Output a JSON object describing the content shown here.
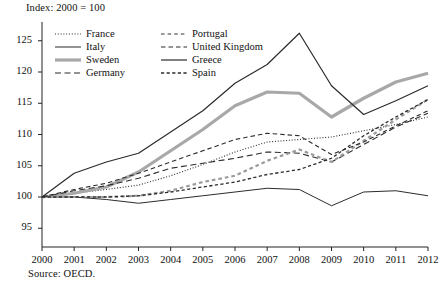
{
  "figure": {
    "index_note": "Index: 2000 = 100",
    "source_note": "Source: OECD."
  },
  "chart_data": {
    "type": "line",
    "title": "Index: 2000 = 100",
    "subtitle": "",
    "xlabel": "",
    "ylabel": "",
    "note": "Index: 2000 = 100",
    "source": "Source: OECD.",
    "grid": false,
    "legend_position": "top-left-inside",
    "x": [
      2000,
      2001,
      2002,
      2003,
      2004,
      2005,
      2006,
      2007,
      2008,
      2009,
      2010,
      2011,
      2012
    ],
    "xlim": [
      2000,
      2012
    ],
    "ylim": [
      92,
      128
    ],
    "yticks": [
      95,
      100,
      105,
      110,
      115,
      120,
      125
    ],
    "xticks": [
      2000,
      2001,
      2002,
      2003,
      2004,
      2005,
      2006,
      2007,
      2008,
      2009,
      2010,
      2011,
      2012
    ],
    "series": [
      {
        "name": "France",
        "style": "dotted",
        "color": "#2b2b2b",
        "width": 1.1,
        "values": [
          100.0,
          100.6,
          101.2,
          101.9,
          103.4,
          105.2,
          107.2,
          108.8,
          109.2,
          109.6,
          110.6,
          111.6,
          112.8
        ]
      },
      {
        "name": "Italy",
        "style": "solid",
        "color": "#2b2b2b",
        "width": 1.0,
        "values": [
          100.0,
          100.0,
          99.6,
          99.0,
          99.6,
          100.2,
          100.8,
          101.4,
          101.2,
          98.6,
          100.8,
          101.0,
          100.2
        ]
      },
      {
        "name": "Sweden",
        "style": "solid",
        "color": "#a8a8a8",
        "width": 3.2,
        "values": [
          100.0,
          100.6,
          101.6,
          104.0,
          107.4,
          110.8,
          114.6,
          116.8,
          116.6,
          112.8,
          115.8,
          118.4,
          119.8
        ]
      },
      {
        "name": "Germany",
        "style": "dashed",
        "color": "#2b2b2b",
        "width": 1.1,
        "values": [
          100.0,
          101.0,
          101.8,
          103.0,
          104.6,
          105.4,
          106.2,
          107.2,
          107.0,
          105.6,
          108.4,
          111.2,
          113.4
        ]
      },
      {
        "name": "Portugal",
        "style": "dashed-gray",
        "color": "#9a9a9a",
        "width": 2.2,
        "values": [
          100.0,
          100.0,
          100.0,
          100.2,
          101.0,
          102.4,
          103.4,
          105.8,
          107.6,
          105.6,
          109.0,
          112.4,
          115.6
        ]
      },
      {
        "name": "United Kingdom",
        "style": "dashed-long",
        "color": "#2b2b2b",
        "width": 1.1,
        "values": [
          100.0,
          101.2,
          102.2,
          103.8,
          105.6,
          107.4,
          109.2,
          110.2,
          109.8,
          106.8,
          108.8,
          111.4,
          113.8
        ]
      },
      {
        "name": "Greece",
        "style": "solid",
        "color": "#2b2b2b",
        "width": 1.2,
        "values": [
          100.0,
          103.8,
          105.6,
          107.0,
          110.4,
          113.8,
          118.2,
          121.2,
          126.2,
          117.8,
          113.2,
          115.4,
          117.8
        ]
      },
      {
        "name": "Spain",
        "style": "dashed-short",
        "color": "#2b2b2b",
        "width": 1.3,
        "values": [
          100.0,
          100.0,
          100.0,
          100.2,
          100.8,
          101.6,
          102.4,
          103.6,
          104.4,
          106.2,
          109.8,
          112.8,
          115.6
        ]
      }
    ],
    "legend_columns": [
      [
        "France",
        "Italy",
        "Sweden",
        "Germany"
      ],
      [
        "Portugal",
        "United Kingdom",
        "Greece",
        "Spain"
      ]
    ]
  }
}
